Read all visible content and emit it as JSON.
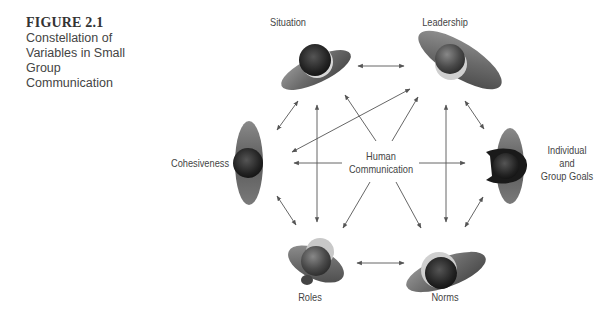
{
  "figure": {
    "number": "FIGURE 2.1",
    "title_lines": [
      "Constellation of",
      "Variables in Small",
      "Group",
      "Communication"
    ]
  },
  "center": {
    "lines": [
      "Human",
      "Communication"
    ]
  },
  "nodes": [
    {
      "id": "situation",
      "label": "Situation"
    },
    {
      "id": "leadership",
      "label": "Leadership"
    },
    {
      "id": "goals",
      "label_lines": [
        "Individual",
        "and",
        "Group Goals"
      ]
    },
    {
      "id": "norms",
      "label": "Norms"
    },
    {
      "id": "roles",
      "label": "Roles"
    },
    {
      "id": "cohesiveness",
      "label": "Cohesiveness"
    }
  ],
  "colors": {
    "text": "#444444",
    "arrow": "#555555"
  }
}
